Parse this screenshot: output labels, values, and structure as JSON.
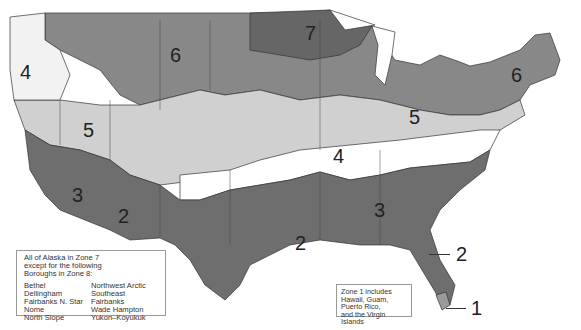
{
  "map": {
    "title": "",
    "colors": {
      "zone_1": "#8a8a8a",
      "zone_2": "#6e6e6e",
      "zone_3": "#6e6e6e",
      "zone_4": "#ffffff",
      "zone_5": "#d2d2d2",
      "zone_6": "#8c8c8c",
      "zone_7": "#6a6a6a",
      "zone_border": "#333333"
    },
    "zone_labels": [
      {
        "id": "zone-4-west",
        "text": "4"
      },
      {
        "id": "zone-6-west",
        "text": "6"
      },
      {
        "id": "zone-7",
        "text": "7"
      },
      {
        "id": "zone-6-east",
        "text": "6"
      },
      {
        "id": "zone-5-west",
        "text": "5"
      },
      {
        "id": "zone-5-east",
        "text": "5"
      },
      {
        "id": "zone-4-central",
        "text": "4"
      },
      {
        "id": "zone-3-west",
        "text": "3"
      },
      {
        "id": "zone-2-west",
        "text": "2"
      },
      {
        "id": "zone-3-south",
        "text": "3"
      },
      {
        "id": "zone-2-south",
        "text": "2"
      },
      {
        "id": "zone-2-florida",
        "text": "2"
      },
      {
        "id": "zone-1",
        "text": "1"
      }
    ]
  },
  "alaska_note": {
    "header": [
      "All of Alaska in Zone 7",
      "except for the following",
      "Boroughs in Zone 8:"
    ],
    "boroughs_col1": [
      "Bethel",
      "Dellingham",
      "Fairbanks N. Star",
      "Nome",
      "North Slope"
    ],
    "boroughs_col2": [
      "Northwest Arctic",
      "Southeast Fairbanks",
      "Wade Hampton",
      "Yukon–Koyukuk"
    ]
  },
  "zone1_note": {
    "lines": [
      "Zone 1 includes",
      "Hawaii, Guam,",
      "Puerto Rico,",
      "and the Virgin Islands"
    ]
  }
}
